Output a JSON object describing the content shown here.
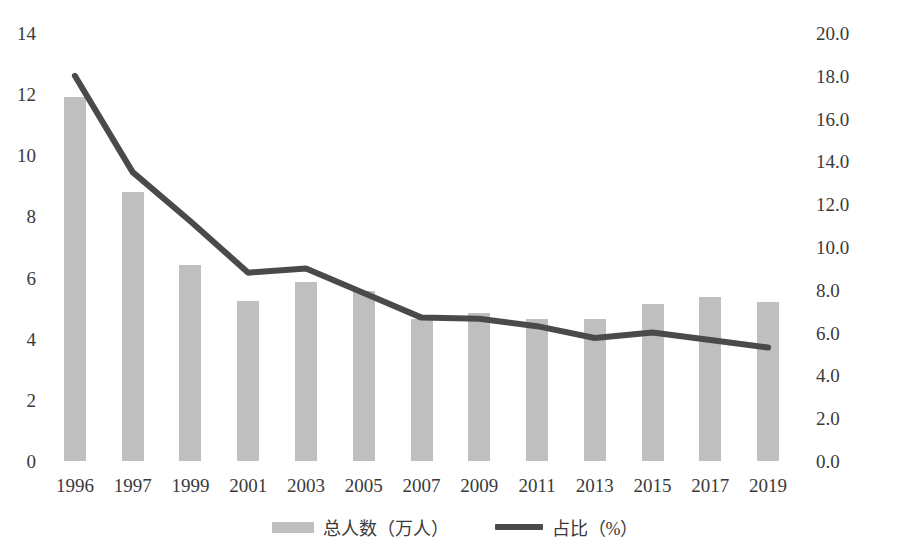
{
  "chart_data": {
    "type": "bar",
    "title": "",
    "subtitle": "",
    "xlabel": "",
    "ylabel": "",
    "grid": false,
    "legend_position": "bottom",
    "categories": [
      "1996",
      "1997",
      "1999",
      "2001",
      "2003",
      "2005",
      "2007",
      "2009",
      "2011",
      "2013",
      "2015",
      "2017",
      "2019"
    ],
    "series": [
      {
        "name": "总人数（万人）",
        "type": "bar",
        "axis": "left",
        "color": "#bfbfbf",
        "values": [
          11.9,
          8.8,
          6.4,
          5.25,
          5.85,
          5.55,
          4.65,
          4.85,
          4.65,
          4.65,
          5.15,
          5.35,
          5.2
        ]
      },
      {
        "name": "占比（%）",
        "type": "line",
        "axis": "right",
        "color": "#4a4a4a",
        "values": [
          18.0,
          13.5,
          11.2,
          8.8,
          9.0,
          7.85,
          6.7,
          6.65,
          6.3,
          5.75,
          6.0,
          5.65,
          5.3
        ]
      }
    ],
    "left_axis": {
      "ticks": [
        "0",
        "2",
        "4",
        "6",
        "8",
        "10",
        "12",
        "14"
      ],
      "min": 0,
      "max": 14
    },
    "right_axis": {
      "ticks": [
        "0.0",
        "2.0",
        "4.0",
        "6.0",
        "8.0",
        "10.0",
        "12.0",
        "14.0",
        "16.0",
        "18.0",
        "20.0"
      ],
      "min": 0,
      "max": 20
    },
    "legend": [
      {
        "label": "总人数（万人）",
        "marker": "bar-swatch",
        "color": "#bfbfbf"
      },
      {
        "label": "占比（%）",
        "marker": "line-swatch",
        "color": "#4a4a4a"
      }
    ]
  }
}
